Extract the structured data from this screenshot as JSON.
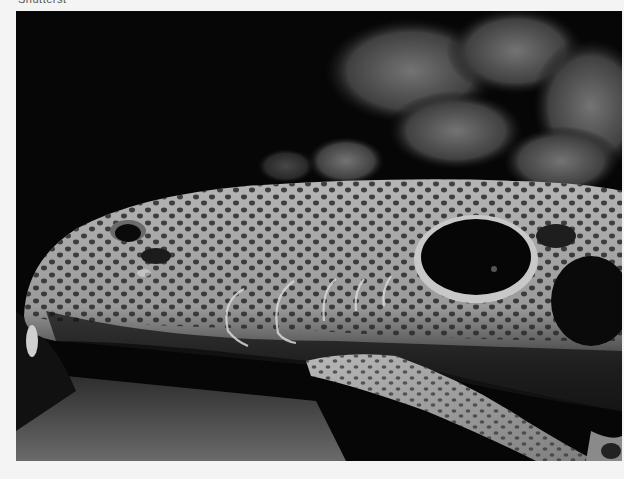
{
  "page": {
    "caption_cutoff": "Shutterst",
    "background": "#f4f4f4"
  },
  "photo": {
    "subject": "epaulette shark head close-up",
    "style": "grayscale",
    "features": [
      "eye",
      "spiracle",
      "gill-slits",
      "epaulette-spot",
      "pectoral-fin",
      "coral-background"
    ]
  }
}
